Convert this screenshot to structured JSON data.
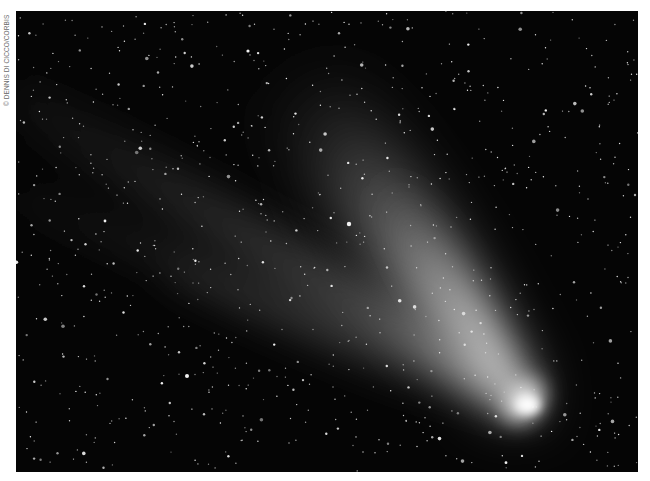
{
  "credit": "© DENNIS DI CICCO/CORBIS",
  "photo": {
    "subject": "comet-with-tails-in-starfield",
    "colors": {
      "sky": "#050505",
      "nucleus": "#ffffff",
      "dust_tail": "#d8d8d8",
      "ion_tail": "#6a6a6a",
      "stars": "#f2f2f2"
    }
  }
}
